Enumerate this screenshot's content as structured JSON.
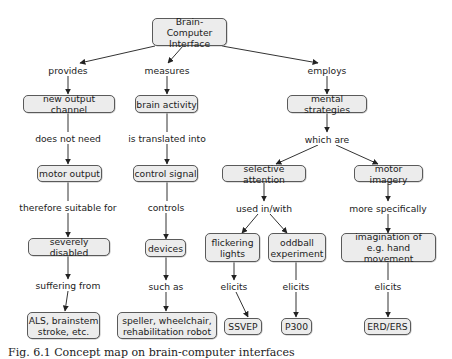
{
  "nodes": {
    "bci": "Brain-Computer\nInterface",
    "new_output_channel": "new output channel",
    "brain_activity": "brain activity",
    "mental_strategies": "mental strategies",
    "motor_output": "motor output",
    "control_signal": "control signal",
    "selective_attention": "selective attention",
    "motor_imagery": "motor imagery",
    "severely_disabled": "severely disabled",
    "devices": "devices",
    "flickering_lights": "flickering\nlights",
    "oddball_experiment": "oddball\nexperiment",
    "imagination": "imagination of\ne.g. hand movement",
    "als": "ALS, brainstem\nstroke, etc.",
    "speller": "speller, wheelchair,\nrehabilitation robot",
    "ssvep": "SSVEP",
    "p300": "P300",
    "erd_ers": "ERD/ERS"
  },
  "links": {
    "provides": "provides",
    "measures": "measures",
    "employs": "employs",
    "does_not_need": "does not need",
    "is_translated_into": "is translated into",
    "which_are": "which are",
    "therefore_suitable_for": "therefore suitable for",
    "controls": "controls",
    "used_in_with": "used in/with",
    "more_specifically": "more specifically",
    "suffering_from": "suffering from",
    "such_as": "such as",
    "elicits_1": "elicits",
    "elicits_2": "elicits",
    "elicits_3": "elicits"
  },
  "caption": "Fig. 6.1 Concept map on brain-computer interfaces",
  "colors": {
    "node_fill": "#ececec",
    "node_border": "#5a5a5a",
    "arrow": "#222222"
  }
}
